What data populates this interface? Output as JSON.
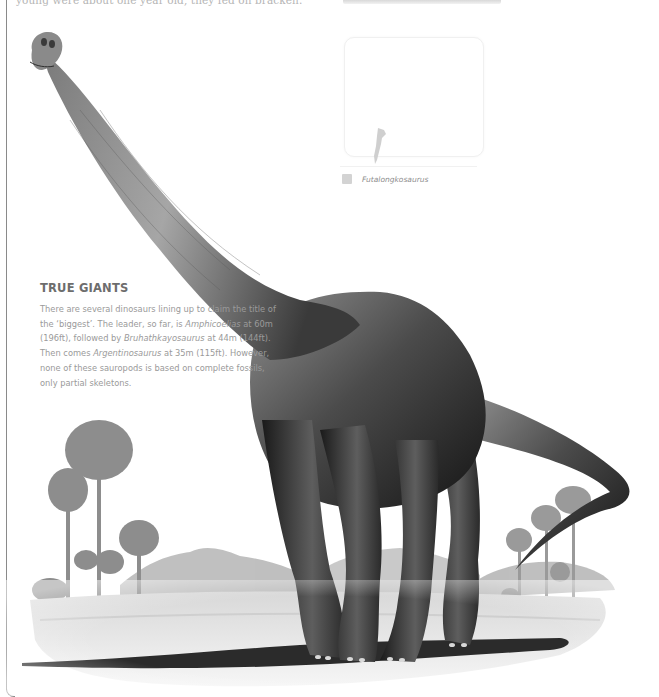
{
  "page": {
    "top_text": "young were about one year old, they fed on bracken."
  },
  "map": {
    "region_label": "South America (Argentina) highlighted",
    "legend": [
      {
        "label": "Futalongkosaurus",
        "swatch_color": "#d3d3d3"
      }
    ]
  },
  "feature": {
    "title": "TRUE GIANTS",
    "body_segments": [
      {
        "text": "There are several dinosaurs lining up to claim the title of the ‘biggest’. The leader, so far, is ",
        "italic": false
      },
      {
        "text": "Amphicoelias",
        "italic": true
      },
      {
        "text": " at 60m (196ft), followed by ",
        "italic": false
      },
      {
        "text": "Bruhathkayosaurus",
        "italic": true
      },
      {
        "text": " at 44m (144ft). Then comes ",
        "italic": false
      },
      {
        "text": "Argentinosaurus",
        "italic": true
      },
      {
        "text": " at 35m (115ft). However, none of these sauropods is based on complete fossils, only partial skeletons.",
        "italic": false
      }
    ]
  },
  "illustration": {
    "subject": "sauropod dinosaur",
    "background": "monkey-puzzle trees, hills, cycads, plain",
    "colors": {
      "skin_dark": "#1e1e1e",
      "skin_mid": "#5a5a5a",
      "skin_light": "#9c9c9c",
      "ground": "#c8c8c8",
      "shadow": "#2a2a2a",
      "trees": "#8f8f8f",
      "hills": "#b4b4b4"
    }
  }
}
